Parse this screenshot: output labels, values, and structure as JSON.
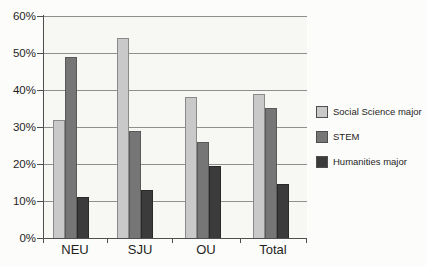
{
  "chart_data": {
    "type": "bar",
    "title": "",
    "categories": [
      "NEU",
      "SJU",
      "OU",
      "Total"
    ],
    "series": [
      {
        "name": "Social Science major",
        "color": "#c9c9c9",
        "border_color": "#8a8a8a",
        "values": [
          32,
          54,
          38,
          39
        ]
      },
      {
        "name": "STEM",
        "color": "#767676",
        "border_color": "#595959",
        "values": [
          49,
          29,
          26,
          35
        ]
      },
      {
        "name": "Humanities major",
        "color": "#3b3b3b",
        "border_color": "#2a2a2a",
        "values": [
          11,
          13,
          19.5,
          14.5
        ]
      }
    ],
    "xlabel": "",
    "ylabel": "",
    "ylim": [
      0,
      60
    ],
    "ytick_step": 10,
    "ytick_labels": [
      "0%",
      "10%",
      "20%",
      "30%",
      "40%",
      "50%",
      "60%"
    ],
    "grid": true,
    "legend_position": "right",
    "value_format": "percent"
  },
  "colors": {
    "axis": "#4f4f4f",
    "gridline": "#8f8f8f",
    "text": "#1f1f1f",
    "plot_background": "#f7f7f4",
    "page_background": "#fcfcfa"
  }
}
